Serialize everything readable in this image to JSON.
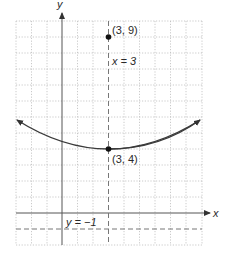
{
  "figure": {
    "axes": {
      "x_label": "x",
      "y_label": "y"
    },
    "points": [
      {
        "label": "(3, 9)",
        "name": "focus"
      },
      {
        "label": "(3, 4)",
        "name": "vertex"
      }
    ],
    "lines": {
      "axis_of_symmetry": "x = 3",
      "directrix": "y = −1"
    },
    "colors": {
      "grid": "#b8b8b8",
      "axis": "#555555",
      "curve": "#3a3a3a",
      "dashed": "#777777"
    }
  }
}
